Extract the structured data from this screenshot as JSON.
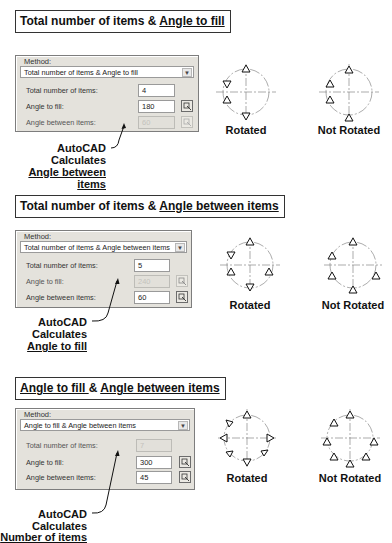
{
  "sections": [
    {
      "title_plain": "Total number of items & ",
      "title_underlined": "Angle to fill",
      "method_label": "Method:",
      "method_value": "Total number of items & Angle to fill",
      "fields": [
        {
          "label": "Total number of items:",
          "value": "4",
          "disabled": false,
          "has_picker": false
        },
        {
          "label": "Angle to fill:",
          "value": "180",
          "disabled": false,
          "has_picker": true
        },
        {
          "label": "Angle between items:",
          "value": "60",
          "disabled": true,
          "has_picker": true
        }
      ],
      "callout_line1": "AutoCAD",
      "callout_line2": "Calculates",
      "callout_line3": "Angle between items",
      "rotated_label": "Rotated",
      "not_rotated_label": "Not Rotated"
    },
    {
      "title_plain": "Total number of items & ",
      "title_underlined": "Angle between items",
      "method_label": "Method:",
      "method_value": "Total number of items & Angle between items",
      "fields": [
        {
          "label": "Total number of items:",
          "value": "5",
          "disabled": false,
          "has_picker": false
        },
        {
          "label": "Angle to fill:",
          "value": "240",
          "disabled": true,
          "has_picker": true
        },
        {
          "label": "Angle between items:",
          "value": "60",
          "disabled": false,
          "has_picker": true
        }
      ],
      "callout_line1": "AutoCAD",
      "callout_line2": "Calculates",
      "callout_line3": "Angle to fill",
      "rotated_label": "Rotated",
      "not_rotated_label": "Not Rotated"
    },
    {
      "title_underlined_a": "Angle to fill ",
      "title_plain": "& ",
      "title_underlined": "Angle between items",
      "method_label": "Method:",
      "method_value": "Angle to fill & Angle between items",
      "fields": [
        {
          "label": "Total number of items:",
          "value": "7",
          "disabled": true,
          "has_picker": false
        },
        {
          "label": "Angle to fill:",
          "value": "300",
          "disabled": false,
          "has_picker": true
        },
        {
          "label": "Angle between items:",
          "value": "45",
          "disabled": false,
          "has_picker": true
        }
      ],
      "callout_line1": "AutoCAD",
      "callout_line2": "Calculates",
      "callout_line3": "Number of items",
      "rotated_label": "Rotated",
      "not_rotated_label": "Not Rotated"
    }
  ],
  "icons": {
    "dropdown": "chevron-down-icon",
    "picker": "pick-angle-icon"
  },
  "colors": {
    "panel_bg": "#e4e2dc",
    "disabled_text": "#c4c3bd",
    "line": "#111111"
  }
}
